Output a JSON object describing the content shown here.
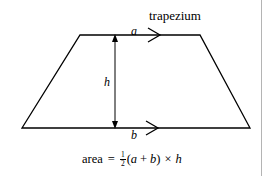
{
  "figure": {
    "name": "trapezium",
    "title_label": "trapezium",
    "stroke_color": "#000000",
    "background_color": "#ffffff",
    "border_color": "#b4b4b4",
    "labels": {
      "top_side": "a",
      "bottom_side": "b",
      "height": "h"
    },
    "formula": {
      "lead": "area",
      "equals": "=",
      "fraction_numerator": "1",
      "fraction_denominator": "2",
      "open_paren": "(",
      "term_a": "a",
      "plus": "+",
      "term_b": "b",
      "close_paren": ")",
      "times": "×",
      "term_h": "h",
      "plain_text": "area = 1/2(a + b) × h"
    },
    "geometry": {
      "top_left": "80,35",
      "top_right": "200,35",
      "bottom_right": "250,128",
      "bottom_left": "22,128",
      "height_arrow_x": "115",
      "height_arrow_top_y": "35",
      "height_arrow_bottom_y": "128"
    }
  }
}
